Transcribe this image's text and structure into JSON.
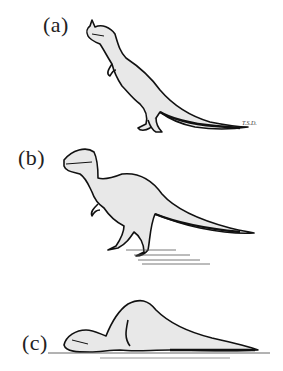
{
  "figure": {
    "panels": [
      {
        "label": "(a)",
        "description": "Crested theropod dinosaur in upright, tail-dragging posture"
      },
      {
        "label": "(b)",
        "description": "Large-headed theropod dinosaur in semi-upright posture with shadow"
      },
      {
        "label": "(c)",
        "description": "Theropod dinosaur crouched/resting on the ground"
      }
    ],
    "signature": "T.S.D.",
    "colors": {
      "body_fill": "#e8e8e8",
      "outline": "#111111",
      "background": "#ffffff"
    }
  }
}
